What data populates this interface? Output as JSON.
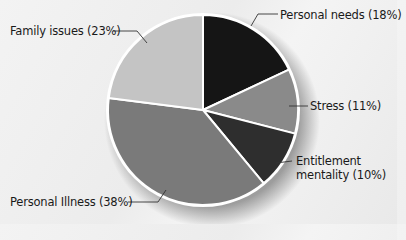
{
  "chart_data": {
    "type": "pie",
    "title": "",
    "start_angle_deg": 0,
    "direction": "clockwise",
    "slices": [
      {
        "label": "Personal needs",
        "value": 18,
        "display": "Personal needs (18%)",
        "color": "#151515"
      },
      {
        "label": "Stress",
        "value": 11,
        "display": "Stress (11%)",
        "color": "#8a8a8a"
      },
      {
        "label": "Entitlement mentality",
        "value": 10,
        "display": "Entitlement mentality (10%)",
        "line1": "Entitlement",
        "line2": "mentality (10%)",
        "color": "#2e2e2e"
      },
      {
        "label": "Personal Illness",
        "value": 38,
        "display": "Personal Illness (38%)",
        "color": "#7a7a7a"
      },
      {
        "label": "Family issues",
        "value": 23,
        "display": "Family issues (23%)",
        "color": "#c4c4c4"
      }
    ],
    "center": [
      203,
      110
    ],
    "radius": 95,
    "separator_color": "#ffffff"
  },
  "labels": {
    "personal_needs": "Personal needs (18%)",
    "stress": "Stress (11%)",
    "entitlement_line1": "Entitlement",
    "entitlement_line2": "mentality (10%)",
    "personal_illness": "Personal Illness (38%)",
    "family_issues": "Family issues (23%)"
  }
}
